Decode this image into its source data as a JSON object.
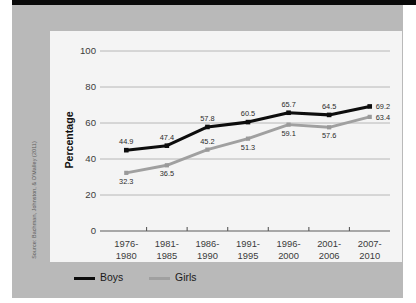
{
  "figure": {
    "source_credit": "Source: Bachman, Johnston, & O'Malley (2011)",
    "y_axis_title": "Percentage"
  },
  "legend": {
    "items": [
      {
        "label": "Boys",
        "color": "#0d0d0d",
        "icon": "line-swatch-icon"
      },
      {
        "label": "Girls",
        "color": "#a0a0a0",
        "icon": "line-swatch-icon"
      }
    ]
  },
  "chart_data": {
    "type": "line",
    "title": "",
    "xlabel": "",
    "ylabel": "Percentage",
    "ylim": [
      0,
      100
    ],
    "yticks": [
      0,
      20,
      40,
      60,
      80,
      100
    ],
    "grid": "horizontal",
    "legend_position": "bottom-left",
    "categories": [
      "1976-\n1980",
      "1981-\n1985",
      "1986-\n1990",
      "1991-\n1995",
      "1996-\n2000",
      "2001-\n2006",
      "2007-\n2010"
    ],
    "categories_lines": [
      [
        "1976-",
        "1980"
      ],
      [
        "1981-",
        "1985"
      ],
      [
        "1986-",
        "1990"
      ],
      [
        "1991-",
        "1995"
      ],
      [
        "1996-",
        "2000"
      ],
      [
        "2001-",
        "2006"
      ],
      [
        "2007-",
        "2010"
      ]
    ],
    "series": [
      {
        "name": "Boys",
        "color": "#0d0d0d",
        "marker": "square",
        "values": [
          44.9,
          47.4,
          57.8,
          60.5,
          65.7,
          64.5,
          69.2
        ],
        "label_positions": [
          "above",
          "above",
          "above",
          "above",
          "above",
          "above",
          "right"
        ]
      },
      {
        "name": "Girls",
        "color": "#9a9a9a",
        "marker": "square",
        "values": [
          32.3,
          36.5,
          45.2,
          51.3,
          59.1,
          57.6,
          63.4
        ],
        "label_positions": [
          "below",
          "below",
          "above",
          "below",
          "below",
          "below",
          "right"
        ]
      }
    ]
  }
}
